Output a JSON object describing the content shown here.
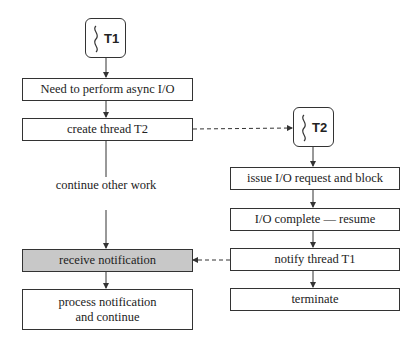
{
  "diagram": {
    "threads": {
      "t1": {
        "label": "T1",
        "icon": "thread-squiggle-icon"
      },
      "t2": {
        "label": "T2",
        "icon": "thread-squiggle-icon"
      }
    },
    "t1_steps": [
      "Need to perform async I/O",
      "create thread T2",
      "receive notification",
      "process notification and continue"
    ],
    "t1_edge_label": "continue other work",
    "t2_steps": [
      "issue I/O request and block",
      "I/O complete — resume",
      "notify thread T1",
      "terminate"
    ],
    "colors": {
      "highlight": "#c8c8c8",
      "stroke": "#333333"
    }
  }
}
